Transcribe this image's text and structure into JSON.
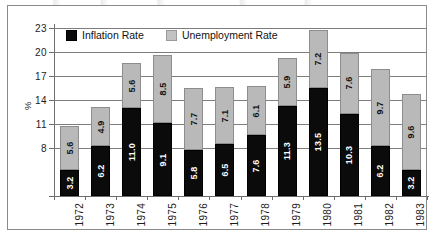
{
  "legend": {
    "items": [
      {
        "label": "Inflation Rate",
        "color": "#0b0b0b",
        "swatch": "black-square-icon"
      },
      {
        "label": "Unemployment Rate",
        "color": "#c2c2c2",
        "swatch": "gray-square-icon"
      }
    ]
  },
  "axis": {
    "y_title": "%",
    "y_ticks": [
      "8",
      "11",
      "14",
      "17",
      "20",
      "23"
    ],
    "y_tick_values": [
      8,
      11,
      14,
      17,
      20,
      23
    ]
  },
  "chart_data": {
    "type": "bar",
    "stacked": true,
    "title": "",
    "subtitle": "",
    "xlabel": "",
    "ylabel": "%",
    "ylim": [
      2,
      23
    ],
    "grid": true,
    "legend_position": "top-left-inside",
    "categories": [
      "1972",
      "1973",
      "1974",
      "1975",
      "1976",
      "1977",
      "1978",
      "1979",
      "1980",
      "1981",
      "1982",
      "1983"
    ],
    "series": [
      {
        "name": "Inflation Rate",
        "color": "#0b0b0b",
        "values": [
          3.2,
          6.2,
          11.0,
          9.1,
          5.8,
          6.5,
          7.6,
          11.3,
          13.5,
          10.3,
          6.2,
          3.2
        ]
      },
      {
        "name": "Unemployment Rate",
        "color": "#b9b9b9",
        "values": [
          5.6,
          4.9,
          5.6,
          8.5,
          7.7,
          7.1,
          6.1,
          5.9,
          7.2,
          7.6,
          9.7,
          9.6
        ]
      }
    ],
    "totals": [
      8.8,
      11.1,
      16.6,
      17.6,
      13.5,
      13.6,
      13.7,
      17.2,
      20.7,
      17.9,
      15.9,
      12.8
    ]
  }
}
